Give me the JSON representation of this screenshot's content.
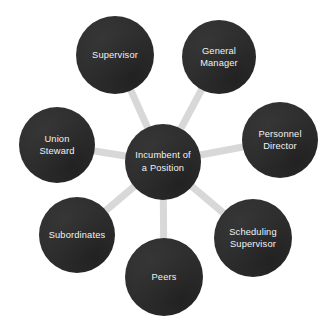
{
  "diagram": {
    "type": "hub-and-spoke",
    "canvas": {
      "width": 327,
      "height": 331,
      "background": "#ffffff"
    },
    "style": {
      "node_fill": "#2d2d2d",
      "node_text_color": "#f2f2f2",
      "edge_color": "#d8d8d8",
      "edge_width": 7
    },
    "center_node": {
      "id": "incumbent",
      "label": "Incumbent of\na Position",
      "cx": 163,
      "cy": 162,
      "r": 38
    },
    "satellite_nodes": [
      {
        "id": "supervisor",
        "label": "Supervisor",
        "cx": 115,
        "cy": 55,
        "r": 39
      },
      {
        "id": "general-manager",
        "label": "General\nManager",
        "cx": 219,
        "cy": 57,
        "r": 37
      },
      {
        "id": "personnel-director",
        "label": "Personnel\nDirector",
        "cx": 280,
        "cy": 140,
        "r": 38
      },
      {
        "id": "scheduling-supervisor",
        "label": "Scheduling\nSupervisor",
        "cx": 253,
        "cy": 238,
        "r": 39
      },
      {
        "id": "peers",
        "label": "Peers",
        "cx": 164,
        "cy": 277,
        "r": 39
      },
      {
        "id": "subordinates",
        "label": "Subordinates",
        "cx": 77,
        "cy": 235,
        "r": 38
      },
      {
        "id": "union-steward",
        "label": "Union\nSteward",
        "cx": 57,
        "cy": 145,
        "r": 38
      }
    ],
    "edges": [
      {
        "from": "incumbent",
        "to": "supervisor"
      },
      {
        "from": "incumbent",
        "to": "general-manager"
      },
      {
        "from": "incumbent",
        "to": "personnel-director"
      },
      {
        "from": "incumbent",
        "to": "scheduling-supervisor"
      },
      {
        "from": "incumbent",
        "to": "peers"
      },
      {
        "from": "incumbent",
        "to": "subordinates"
      },
      {
        "from": "incumbent",
        "to": "union-steward"
      }
    ]
  }
}
